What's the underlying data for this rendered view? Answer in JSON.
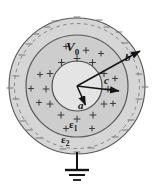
{
  "figure": {
    "background": "#ffffff",
    "colors": {
      "shell_fill_outer": "#d6d6d6",
      "shell_fill_inner": "#cfcfcf",
      "core_fill": "#e3e3e3",
      "stroke": "#4a4a4a",
      "label": "#141414",
      "charge_plus": "#3a3a3a",
      "charge_minus": "#6e6e6e"
    },
    "geometry": {
      "center_x": 77,
      "center_y": 86,
      "radius_outer_b_px": 68,
      "radius_dashed_px": 63,
      "radius_middle_c_px": 51,
      "radius_inner_a_px": 25
    }
  },
  "labels": {
    "potential": "V",
    "potential_sub": "0",
    "radius_a": "a",
    "radius_c": "c",
    "radius_b": "b",
    "permittivity_1": "ε",
    "permittivity_1_sub": "1",
    "permittivity_2": "ε",
    "permittivity_2_sub": "2"
  },
  "annotations": {
    "arrow_a": "radius-arrow-a",
    "arrow_c": "radius-arrow-c",
    "arrow_b": "radius-arrow-b",
    "ground": "ground-symbol",
    "ground_lead": "ground-lead-line",
    "dashed_circle": "dashed-boundary-circle",
    "plus_charges": "positive-surface-charges",
    "minus_charges": "negative-surface-charges"
  }
}
